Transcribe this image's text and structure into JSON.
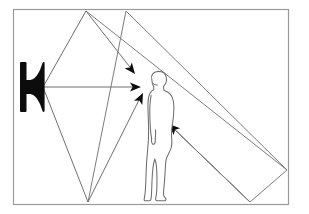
{
  "diagram": {
    "background_color": "#ffffff",
    "line_color": "#808080",
    "ink_color": "#000000",
    "frame": {
      "label": "room-boundary",
      "x": 13,
      "y": 9,
      "width": 275,
      "height": 195,
      "stroke": "#9a9a9a",
      "stroke_width": 1.2
    },
    "source": {
      "label": "loudspeaker",
      "type": "horn-speaker",
      "origin_x": 43,
      "origin_y": 87,
      "fill": "#111111"
    },
    "listener": {
      "label": "listener",
      "type": "human-figure-profile",
      "facing": "left",
      "stroke": "#6e6e6e",
      "fill": "#ffffff"
    },
    "rays": [
      {
        "id": "ray-direct",
        "label": "direct sound path",
        "order": 1,
        "points": "43,87 138,87",
        "reflections": 0,
        "arrow": {
          "x": 140,
          "y": 87,
          "angle": 0
        }
      },
      {
        "id": "ray-ceiling-reflection",
        "label": "first reflection off top boundary",
        "order": 2,
        "points": "43,87 86,11 133,71",
        "reflections": 1,
        "arrow": {
          "x": 135,
          "y": 73,
          "angle": 52
        }
      },
      {
        "id": "ray-floor-reflection",
        "label": "first reflection off bottom boundary",
        "order": 3,
        "points": "43,87 88,202 141,96",
        "reflections": 1,
        "arrow": {
          "x": 143,
          "y": 93,
          "angle": -64
        }
      },
      {
        "id": "ray-rear-reflection",
        "label": "multiple reflection via right boundary",
        "order": 4,
        "points": "86,11 287,170 250,202 171,126",
        "reflections": 2,
        "arrow": {
          "x": 168,
          "y": 124,
          "angle": -136
        }
      },
      {
        "id": "ray-long-diagonal",
        "label": "second reflected wavefront edge",
        "order": 5,
        "points": "126,11 287,170",
        "reflections": 0,
        "arrow": null
      },
      {
        "id": "ray-diagonal-return",
        "label": "wavefront edge returning to bottom",
        "order": 6,
        "points": "126,11 88,202",
        "reflections": 0,
        "arrow": null
      },
      {
        "id": "ray-lower-right-edge",
        "label": "lower right boundary segment",
        "order": 7,
        "points": "250,202 171,126",
        "reflections": 0,
        "arrow": null
      }
    ],
    "arrowheads": [
      {
        "id": "arrowhead-top",
        "name": "arrowhead-ceiling-reflection"
      },
      {
        "id": "arrowhead-middle",
        "name": "arrowhead-direct"
      },
      {
        "id": "arrowhead-lower",
        "name": "arrowhead-floor-reflection"
      },
      {
        "id": "arrowhead-right",
        "name": "arrowhead-rear-reflection"
      }
    ]
  }
}
